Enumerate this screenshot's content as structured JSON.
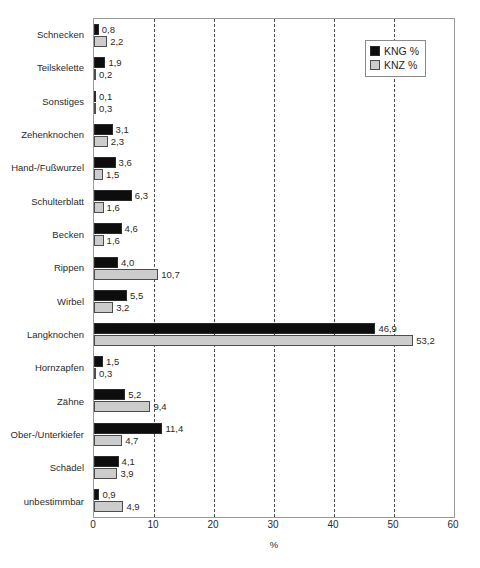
{
  "chart_data": {
    "type": "bar",
    "orientation": "horizontal",
    "title": "",
    "xlabel": "%",
    "ylabel": "",
    "xlim": [
      0,
      60
    ],
    "xticks": [
      0,
      10,
      20,
      30,
      40,
      50,
      60
    ],
    "xtick_labels": [
      "0",
      "10",
      "20",
      "30",
      "40",
      "50",
      "60"
    ],
    "grid": "vertical-dashed",
    "legend_position": "top-right",
    "decimal_separator": ",",
    "categories": [
      "Schnecken",
      "Teilskelette",
      "Sonstiges",
      "Zehenknochen",
      "Hand-/Fußwurzel",
      "Schulterblatt",
      "Becken",
      "Rippen",
      "Wirbel",
      "Langknochen",
      "Hornzapfen",
      "Zähne",
      "Ober-/Unterkiefer",
      "Schädel",
      "unbestimmbar"
    ],
    "series": [
      {
        "name": "KNG %",
        "color": "#0d0d0d",
        "values": [
          0.8,
          1.9,
          0.1,
          3.1,
          3.6,
          6.3,
          4.6,
          4.0,
          5.5,
          46.9,
          1.5,
          5.2,
          11.4,
          4.1,
          0.9
        ],
        "labels": [
          "0,8",
          "1,9",
          "0,1",
          "3,1",
          "3,6",
          "6,3",
          "4,6",
          "4,0",
          "5,5",
          "46,9",
          "1,5",
          "5,2",
          "11,4",
          "4,1",
          "0,9"
        ]
      },
      {
        "name": "KNZ %",
        "color": "#cccccc",
        "values": [
          2.2,
          0.2,
          0.3,
          2.3,
          1.5,
          1.6,
          1.6,
          10.7,
          3.2,
          53.2,
          0.3,
          9.4,
          4.7,
          3.9,
          4.9
        ],
        "labels": [
          "2,2",
          "0,2",
          "0,3",
          "2,3",
          "1,5",
          "1,6",
          "1,6",
          "10,7",
          "3,2",
          "53,2",
          "0,3",
          "9,4",
          "4,7",
          "3,9",
          "4,9"
        ]
      }
    ]
  },
  "legend": {
    "items": [
      {
        "label": "KNG %",
        "swatch": "kng"
      },
      {
        "label": "KNZ %",
        "swatch": "knz"
      }
    ]
  },
  "axis": {
    "x_title": "%"
  }
}
